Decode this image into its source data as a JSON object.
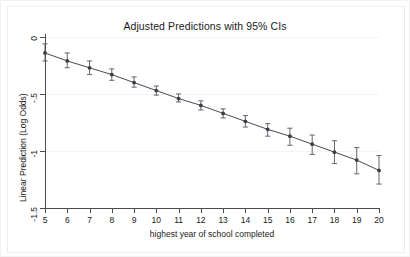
{
  "figure": {
    "title": "Adjusted Predictions with 95% CIs",
    "background_color": "#ffffff",
    "frame_color": "#ededed"
  },
  "chart_data": {
    "type": "line",
    "title": "Adjusted Predictions with 95% CIs",
    "xlabel": "highest year of school completed",
    "ylabel": "Linear Prediction (Log Odds)",
    "xlim": [
      5,
      20
    ],
    "ylim": [
      -1.5,
      0
    ],
    "grid": true,
    "legend": null,
    "line_color": "#4a4a52",
    "marker_color": "#3b3b42",
    "errorbar_color": "#55555d",
    "x_tick_labels": [
      "5",
      "6",
      "7",
      "8",
      "9",
      "10",
      "11",
      "12",
      "13",
      "14",
      "15",
      "16",
      "17",
      "18",
      "19",
      "20"
    ],
    "y_tick_labels": [
      "0",
      "-.5",
      "-1",
      "-1.5"
    ],
    "y_ticks": [
      0,
      -0.5,
      -1,
      -1.5
    ],
    "x": [
      5,
      6,
      7,
      8,
      9,
      10,
      11,
      12,
      13,
      14,
      15,
      16,
      17,
      18,
      19,
      20
    ],
    "values": [
      -0.14,
      -0.21,
      -0.27,
      -0.33,
      -0.4,
      -0.47,
      -0.54,
      -0.6,
      -0.67,
      -0.74,
      -0.81,
      -0.87,
      -0.94,
      -1.01,
      -1.08,
      -1.17
    ],
    "ci_lower": [
      -0.21,
      -0.27,
      -0.33,
      -0.38,
      -0.44,
      -0.51,
      -0.57,
      -0.64,
      -0.71,
      -0.79,
      -0.87,
      -0.95,
      -1.03,
      -1.11,
      -1.2,
      -1.29
    ],
    "ci_upper": [
      -0.06,
      -0.14,
      -0.21,
      -0.28,
      -0.35,
      -0.43,
      -0.5,
      -0.56,
      -0.63,
      -0.69,
      -0.76,
      -0.8,
      -0.86,
      -0.91,
      -0.97,
      -1.04
    ],
    "series": [
      {
        "name": "Linear Prediction",
        "values": [
          -0.14,
          -0.21,
          -0.27,
          -0.33,
          -0.4,
          -0.47,
          -0.54,
          -0.6,
          -0.67,
          -0.74,
          -0.81,
          -0.87,
          -0.94,
          -1.01,
          -1.08,
          -1.17
        ]
      }
    ]
  }
}
